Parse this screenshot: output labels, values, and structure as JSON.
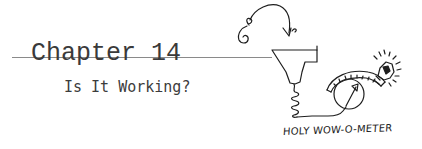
{
  "header": {
    "chapter_label": "Chapter 14",
    "subtitle": "Is It Working?"
  },
  "illustration": {
    "caption": "HOLY WOW-O-METER",
    "elements": [
      "curly-arrow",
      "funnel",
      "spring-coil",
      "wire",
      "meter-gauge",
      "light-bulb"
    ]
  },
  "colors": {
    "text": "#3a3a3a",
    "rule": "#8a8a8a",
    "ink": "#1e1e1e",
    "background": "#ffffff"
  }
}
